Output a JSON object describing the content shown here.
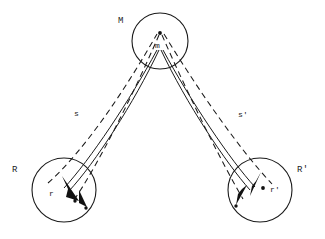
{
  "figure": {
    "background_color": "#ffffff",
    "stroke_color": "#1a1a1a",
    "width": 325,
    "height": 239
  },
  "labels": {
    "mass_region": "M",
    "mass_point": "m",
    "source_region": "R",
    "source_point": "r",
    "image_region": "R'",
    "image_point": "r'",
    "path_left": "s",
    "path_right": "s'"
  },
  "circles": [
    {
      "name": "M",
      "cx": 160,
      "cy": 41,
      "r": 28
    },
    {
      "name": "R",
      "cx": 64,
      "cy": 190,
      "r": 32
    },
    {
      "name": "R'",
      "cx": 260,
      "cy": 190,
      "r": 32
    }
  ],
  "points": [
    {
      "name": "m",
      "x": 160,
      "y": 33
    },
    {
      "name": "r",
      "x": 75,
      "y": 196
    },
    {
      "name": "r2",
      "x": 73,
      "y": 202
    },
    {
      "name": "r-prime",
      "x": 262,
      "y": 188
    },
    {
      "name": "r-prime2",
      "x": 240,
      "y": 203
    }
  ],
  "paths": {
    "solid_count": 4,
    "dashed_count": 4,
    "description": "Two solid ray bundles and two dashed ray bundles converge at the mass m and diverge to regions R and R'"
  }
}
